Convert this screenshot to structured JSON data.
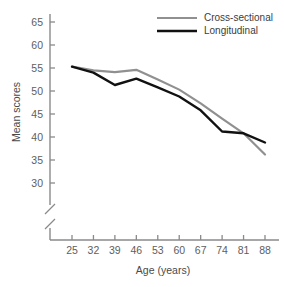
{
  "chart_data": {
    "type": "line",
    "title": "",
    "xlabel": "Age (years)",
    "ylabel": "Mean scores",
    "x": [
      25,
      32,
      39,
      46,
      53,
      60,
      67,
      74,
      81,
      88
    ],
    "xtick_labels": [
      "25",
      "32",
      "39",
      "46",
      "53",
      "60",
      "67",
      "74",
      "81",
      "88"
    ],
    "ytick_labels": [
      "30",
      "35",
      "40",
      "45",
      "50",
      "55",
      "60",
      "65"
    ],
    "yticks": [
      30,
      35,
      40,
      45,
      50,
      55,
      60,
      65
    ],
    "ylim": [
      30,
      65
    ],
    "xlim": [
      25,
      88
    ],
    "axis_break": true,
    "grid": false,
    "legend_position": "top-right",
    "series": [
      {
        "name": "Cross-sectional",
        "color": "#909090",
        "values": [
          55.3,
          54.5,
          54.1,
          54.6,
          52.5,
          50.3,
          47.3,
          44.0,
          40.8,
          36.2
        ]
      },
      {
        "name": "Longitudinal",
        "color": "#111111",
        "values": [
          55.3,
          54.0,
          51.3,
          52.7,
          50.8,
          48.8,
          45.8,
          41.2,
          40.8,
          38.8
        ]
      }
    ]
  },
  "legend": {
    "items": [
      {
        "label": "Cross-sectional",
        "color": "#909090"
      },
      {
        "label": "Longitudinal",
        "color": "#111111"
      }
    ]
  },
  "axes": {
    "y_title": "Mean scores",
    "x_title": "Age (years)"
  }
}
